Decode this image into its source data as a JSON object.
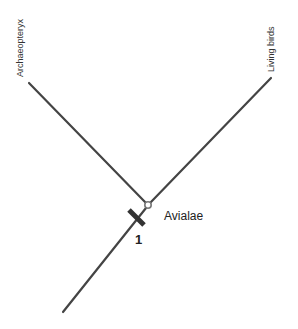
{
  "diagram": {
    "type": "cladogram",
    "taxa": [
      {
        "name": "Archaeopteryx"
      },
      {
        "name": "Living birds"
      }
    ],
    "clade": {
      "name": "Avialae"
    },
    "synapomorphy_marker": {
      "number": "1"
    },
    "colors": {
      "branch": "#444444",
      "node_fill": "#ffffff",
      "node_stroke": "#777777",
      "text": "#222222"
    }
  }
}
